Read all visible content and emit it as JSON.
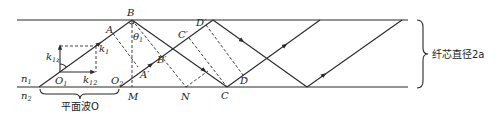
{
  "figure": {
    "type": "optical-fiber-ray-diagram",
    "core_diameter_label": "纤芯直径2a",
    "plane_wave_label": "平面波O",
    "media": {
      "n1": "n",
      "n1_sub": "1",
      "n2": "n",
      "n2_sub": "2"
    },
    "points": {
      "B": "B",
      "A": "A",
      "A_prime": "A′",
      "B_prime": "B′",
      "C": "C",
      "C_prime": "C′",
      "D": "D",
      "D_prime": "D′",
      "M": "M",
      "N": "N",
      "O1": "O",
      "O1_sub": "1",
      "O2": "O",
      "O2_sub": "2"
    },
    "angle": {
      "symbol": "θ",
      "sub": "1"
    },
    "vectors": {
      "k1": "k",
      "k1_sub": "1",
      "k1z": "k",
      "k1z_sub": "1z",
      "k12": "k",
      "k12_sub": "12"
    },
    "colors": {
      "line": "#2a2a2a",
      "background": "#ffffff"
    }
  }
}
